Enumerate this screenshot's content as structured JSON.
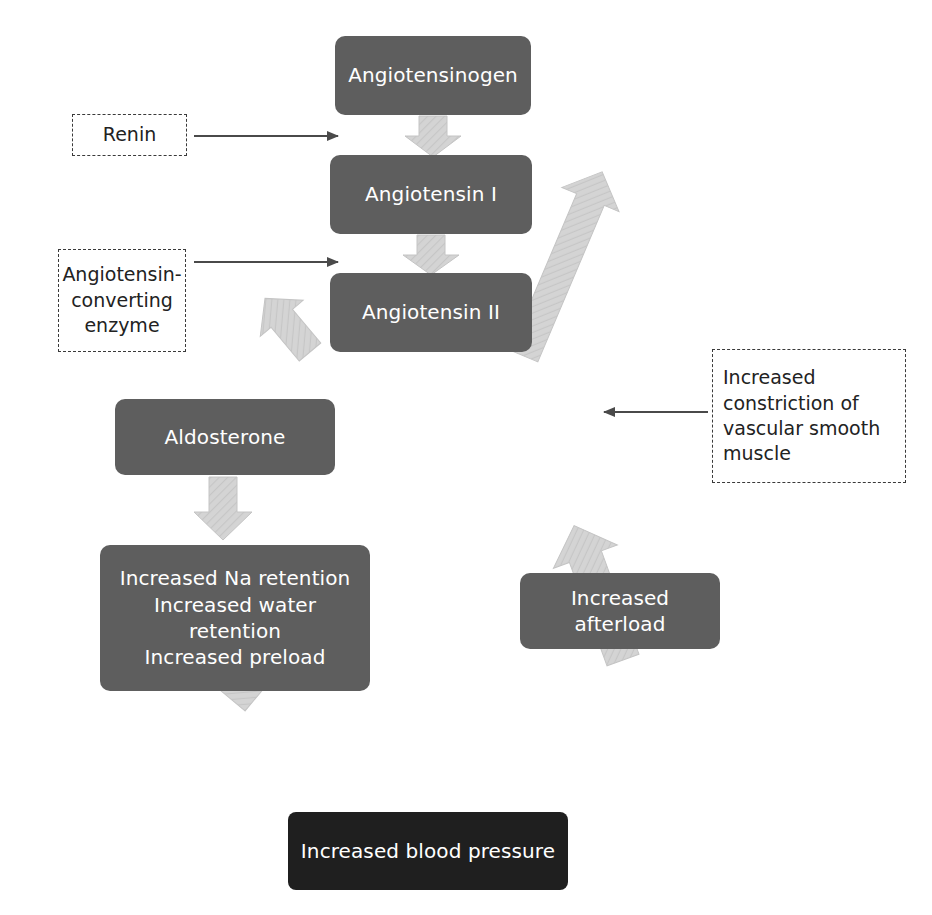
{
  "diagram": {
    "colors": {
      "node_fill": "#5e5e5e",
      "node_fill_dark": "#1f1f1f",
      "node_text": "#ffffff",
      "block_arrow_fill": "#d2d2d2",
      "block_arrow_stroke": "#c4c4c4",
      "thin_arrow": "#4a4a4a",
      "dashed_border": "#3a3a3a",
      "dashed_text": "#222222",
      "background": "#ffffff"
    },
    "nodes": [
      {
        "id": "angiotensinogen",
        "label": "Angiotensinogen",
        "x": 335,
        "y": 36,
        "w": 196,
        "h": 79,
        "style": "gray"
      },
      {
        "id": "angiotensin-1",
        "label": "Angiotensin I",
        "x": 330,
        "y": 155,
        "w": 202,
        "h": 79,
        "style": "gray"
      },
      {
        "id": "angiotensin-2",
        "label": "Angiotensin II",
        "x": 330,
        "y": 273,
        "w": 202,
        "h": 79,
        "style": "gray"
      },
      {
        "id": "aldosterone",
        "label": "Aldosterone",
        "x": 115,
        "y": 399,
        "w": 220,
        "h": 76,
        "style": "gray"
      },
      {
        "id": "na-water-preload",
        "label": "Increased Na retention\nIncreased water retention\nIncreased preload",
        "x": 100,
        "y": 545,
        "w": 270,
        "h": 146,
        "style": "gray"
      },
      {
        "id": "increased-afterload",
        "label": "Increased afterload",
        "x": 520,
        "y": 573,
        "w": 200,
        "h": 76,
        "style": "gray"
      },
      {
        "id": "increased-blood-pressure",
        "label": "Increased blood pressure",
        "x": 288,
        "y": 812,
        "w": 280,
        "h": 78,
        "style": "dark"
      }
    ],
    "annotations": [
      {
        "id": "renin",
        "label": "Renin",
        "x": 72,
        "y": 114,
        "w": 115,
        "h": 42,
        "align": "center"
      },
      {
        "id": "ace",
        "label": "Angiotensin-\nconverting\nenzyme",
        "x": 58,
        "y": 249,
        "w": 128,
        "h": 103,
        "align": "center"
      },
      {
        "id": "vasoconstriction",
        "label": "Increased\nconstriction of\nvascular smooth\nmuscle",
        "x": 712,
        "y": 349,
        "w": 194,
        "h": 134,
        "align": "left"
      }
    ],
    "thin_arrows": [
      {
        "id": "renin-to-angiotensin-1",
        "from": [
          193,
          136
        ],
        "to": [
          340,
          136
        ],
        "direction": "right"
      },
      {
        "id": "ace-to-angiotensin-2",
        "from": [
          193,
          262
        ],
        "to": [
          340,
          262
        ],
        "direction": "right"
      },
      {
        "id": "vasoconstriction-to-afterload-path",
        "from": [
          707,
          412
        ],
        "to": [
          602,
          412
        ],
        "direction": "left"
      }
    ],
    "block_arrows": [
      {
        "id": "angiotensinogen-to-angiotensin-1",
        "from": "angiotensinogen",
        "to": "angiotensin-1",
        "orientation": "down"
      },
      {
        "id": "angiotensin-1-to-angiotensin-2",
        "from": "angiotensin-1",
        "to": "angiotensin-2",
        "orientation": "down"
      },
      {
        "id": "angiotensin-2-to-aldosterone",
        "from": "angiotensin-2",
        "to": "aldosterone",
        "orientation": "down-left"
      },
      {
        "id": "angiotensin-2-to-afterload",
        "from": "angiotensin-2",
        "to": "increased-afterload",
        "orientation": "down-right"
      },
      {
        "id": "aldosterone-to-preload",
        "from": "aldosterone",
        "to": "na-water-preload",
        "orientation": "down"
      },
      {
        "id": "preload-to-blood-pressure",
        "from": "na-water-preload",
        "to": "increased-blood-pressure",
        "orientation": "down-right"
      },
      {
        "id": "afterload-to-blood-pressure",
        "from": "increased-afterload",
        "to": "increased-blood-pressure",
        "orientation": "down-left"
      }
    ],
    "caption": ""
  }
}
